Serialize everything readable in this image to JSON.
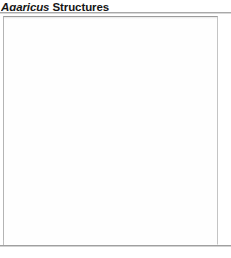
{
  "figure": {
    "title": {
      "genus": "Agaricus",
      "rest": " Structures",
      "full": "Agaricus Structures"
    },
    "placeholder": {
      "label": "",
      "content": ""
    },
    "colors": {
      "background": "#ffffff",
      "title_text": "#161616",
      "rule": "#a9a9a9",
      "box_border": "#b4b4b4",
      "box_fill": "#fefefe"
    }
  }
}
